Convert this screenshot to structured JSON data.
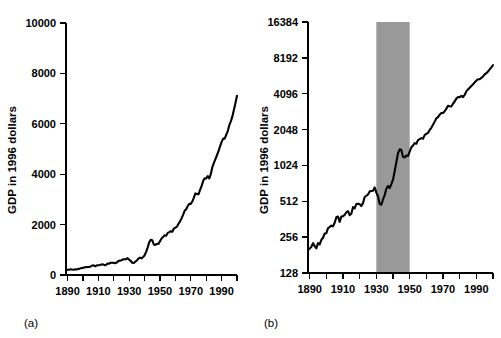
{
  "figure": {
    "background_color": "#ffffff",
    "line_color": "#000000",
    "shade_color": "#999999"
  },
  "panel_a": {
    "label": "(a)",
    "ylabel": "GDP in 1996 dollars",
    "y_ticks": [
      "0",
      "2000",
      "4000",
      "6000",
      "8000",
      "10000"
    ],
    "x_ticks": [
      "1890",
      "1910",
      "1930",
      "1950",
      "1970",
      "1990"
    ]
  },
  "panel_b": {
    "label": "(b)",
    "ylabel": "GDP in 1996 dollars",
    "y_ticks": [
      "128",
      "256",
      "512",
      "1024",
      "2048",
      "4096",
      "8192",
      "16384"
    ],
    "x_ticks": [
      "1890",
      "1910",
      "1930",
      "1950",
      "1970",
      "1990"
    ],
    "shaded_band_label": "1930-1950"
  },
  "chart_data": [
    {
      "type": "line",
      "id": "panel-a",
      "title": "",
      "xlabel": "",
      "ylabel": "GDP in 1996 dollars",
      "yscale": "linear",
      "ylim": [
        0,
        10000
      ],
      "xlim": [
        1889,
        2000
      ],
      "yticks": [
        0,
        2000,
        4000,
        6000,
        8000,
        10000
      ],
      "xticks": [
        1890,
        1900,
        1910,
        1920,
        1930,
        1940,
        1950,
        1960,
        1970,
        1980,
        1990,
        2000
      ],
      "xticklabels": [
        "1890",
        "",
        "1910",
        "",
        "1930",
        "",
        "1950",
        "",
        "1970",
        "",
        "1990",
        ""
      ],
      "grid": false,
      "legend": null,
      "annotations": [
        "(a)"
      ],
      "x": [
        1889,
        1890,
        1891,
        1892,
        1893,
        1894,
        1895,
        1896,
        1897,
        1898,
        1899,
        1900,
        1901,
        1902,
        1903,
        1904,
        1905,
        1906,
        1907,
        1908,
        1909,
        1910,
        1911,
        1912,
        1913,
        1914,
        1915,
        1916,
        1917,
        1918,
        1919,
        1920,
        1921,
        1922,
        1923,
        1924,
        1925,
        1926,
        1927,
        1928,
        1929,
        1930,
        1931,
        1932,
        1933,
        1934,
        1935,
        1936,
        1937,
        1938,
        1939,
        1940,
        1941,
        1942,
        1943,
        1944,
        1945,
        1946,
        1947,
        1948,
        1949,
        1950,
        1951,
        1952,
        1953,
        1954,
        1955,
        1956,
        1957,
        1958,
        1959,
        1960,
        1961,
        1962,
        1963,
        1964,
        1965,
        1966,
        1967,
        1968,
        1969,
        1970,
        1971,
        1972,
        1973,
        1974,
        1975,
        1976,
        1977,
        1978,
        1979,
        1980,
        1981,
        1982,
        1983,
        1984,
        1985,
        1986,
        1987,
        1988,
        1989,
        1990,
        1991,
        1992,
        1993,
        1994,
        1995,
        1996,
        1997,
        1998,
        1999,
        2000
      ],
      "y": [
        200,
        205,
        212,
        228,
        215,
        206,
        228,
        222,
        243,
        253,
        274,
        276,
        305,
        311,
        320,
        315,
        338,
        376,
        381,
        344,
        381,
        384,
        394,
        414,
        424,
        391,
        402,
        457,
        447,
        486,
        487,
        483,
        467,
        494,
        556,
        570,
        584,
        620,
        624,
        628,
        670,
        606,
        565,
        487,
        479,
        530,
        577,
        653,
        688,
        661,
        714,
        777,
        915,
        1086,
        1296,
        1398,
        1379,
        1210,
        1194,
        1240,
        1230,
        1340,
        1450,
        1505,
        1575,
        1556,
        1670,
        1702,
        1736,
        1716,
        1838,
        1881,
        1919,
        2033,
        2121,
        2246,
        2388,
        2546,
        2608,
        2733,
        2821,
        2823,
        2916,
        3068,
        3238,
        3219,
        3202,
        3374,
        3524,
        3726,
        3838,
        3827,
        3927,
        3833,
        4000,
        4283,
        4450,
        4599,
        4752,
        4914,
        5106,
        5273,
        5412,
        5411,
        5563,
        5712,
        5944,
        6095,
        6293,
        6558,
        6822,
        7110,
        7402,
        7698
      ]
    },
    {
      "type": "line",
      "id": "panel-b",
      "title": "",
      "xlabel": "",
      "ylabel": "GDP in 1996 dollars",
      "yscale": "log2",
      "ylim": [
        128,
        16384
      ],
      "xlim": [
        1889,
        2000
      ],
      "yticks": [
        128,
        256,
        512,
        1024,
        2048,
        4096,
        8192,
        16384
      ],
      "xticks": [
        1890,
        1900,
        1910,
        1920,
        1930,
        1940,
        1950,
        1960,
        1970,
        1980,
        1990,
        2000
      ],
      "xticklabels": [
        "1890",
        "",
        "1910",
        "",
        "1930",
        "",
        "1950",
        "",
        "1970",
        "",
        "1990",
        ""
      ],
      "grid": false,
      "legend": null,
      "annotations": [
        "(b)"
      ],
      "shaded_region": {
        "x0": 1930,
        "x1": 1950,
        "color": "#999999"
      },
      "x": [
        1889,
        1890,
        1891,
        1892,
        1893,
        1894,
        1895,
        1896,
        1897,
        1898,
        1899,
        1900,
        1901,
        1902,
        1903,
        1904,
        1905,
        1906,
        1907,
        1908,
        1909,
        1910,
        1911,
        1912,
        1913,
        1914,
        1915,
        1916,
        1917,
        1918,
        1919,
        1920,
        1921,
        1922,
        1923,
        1924,
        1925,
        1926,
        1927,
        1928,
        1929,
        1930,
        1931,
        1932,
        1933,
        1934,
        1935,
        1936,
        1937,
        1938,
        1939,
        1940,
        1941,
        1942,
        1943,
        1944,
        1945,
        1946,
        1947,
        1948,
        1949,
        1950,
        1951,
        1952,
        1953,
        1954,
        1955,
        1956,
        1957,
        1958,
        1959,
        1960,
        1961,
        1962,
        1963,
        1964,
        1965,
        1966,
        1967,
        1968,
        1969,
        1970,
        1971,
        1972,
        1973,
        1974,
        1975,
        1976,
        1977,
        1978,
        1979,
        1980,
        1981,
        1982,
        1983,
        1984,
        1985,
        1986,
        1987,
        1988,
        1989,
        1990,
        1991,
        1992,
        1993,
        1994,
        1995,
        1996,
        1997,
        1998,
        1999,
        2000
      ],
      "y": [
        200,
        205,
        212,
        228,
        215,
        206,
        228,
        222,
        243,
        253,
        274,
        276,
        305,
        311,
        320,
        315,
        338,
        376,
        381,
        344,
        381,
        384,
        394,
        414,
        424,
        391,
        402,
        457,
        447,
        486,
        487,
        483,
        467,
        494,
        556,
        570,
        584,
        620,
        624,
        628,
        670,
        606,
        565,
        487,
        479,
        530,
        577,
        653,
        688,
        661,
        714,
        777,
        915,
        1086,
        1296,
        1398,
        1379,
        1210,
        1194,
        1240,
        1230,
        1340,
        1450,
        1505,
        1575,
        1556,
        1670,
        1702,
        1736,
        1716,
        1838,
        1881,
        1919,
        2033,
        2121,
        2246,
        2388,
        2546,
        2608,
        2733,
        2821,
        2823,
        2916,
        3068,
        3238,
        3219,
        3202,
        3374,
        3524,
        3726,
        3838,
        3827,
        3927,
        3833,
        4000,
        4283,
        4450,
        4599,
        4752,
        4914,
        5106,
        5273,
        5412,
        5411,
        5563,
        5712,
        5944,
        6095,
        6293,
        6558,
        6822,
        7110,
        7402,
        7698
      ]
    }
  ]
}
